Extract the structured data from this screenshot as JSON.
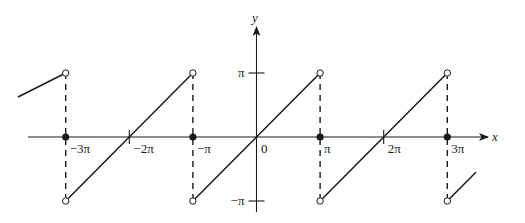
{
  "figure": {
    "title": "",
    "colors": {
      "ink": "#1a1a1a",
      "background": "#ffffff"
    }
  },
  "axes": {
    "x_label": "x",
    "y_label": "y",
    "origin_label": "0",
    "x_ticks": [
      {
        "value": -3,
        "label": "−3π"
      },
      {
        "value": -2,
        "label": "−2π"
      },
      {
        "value": -1,
        "label": "−π"
      },
      {
        "value": 1,
        "label": "π"
      },
      {
        "value": 2,
        "label": "2π"
      },
      {
        "value": 3,
        "label": "3π"
      }
    ],
    "y_ticks": [
      {
        "value": 1,
        "label": "π"
      },
      {
        "value": -1,
        "label": "−π"
      }
    ]
  },
  "plot": {
    "unit_x_px": 63.6,
    "unit_y_px": 64,
    "origin_px": [
      256.5,
      137
    ],
    "segments": [
      {
        "from": [
          -3.75,
          0.625
        ],
        "to": [
          -3,
          1
        ]
      },
      {
        "from": [
          -3,
          -1
        ],
        "to": [
          -1,
          1
        ]
      },
      {
        "from": [
          -1,
          -1
        ],
        "to": [
          1,
          1
        ]
      },
      {
        "from": [
          1,
          -1
        ],
        "to": [
          3,
          1
        ]
      },
      {
        "from": [
          3,
          -1
        ],
        "to": [
          3.45,
          -0.55
        ]
      }
    ],
    "discontinuities": [
      -3,
      -1,
      1,
      3
    ],
    "filled_points": [
      [
        -3,
        0
      ],
      [
        -1,
        0
      ],
      [
        1,
        0
      ],
      [
        3,
        0
      ]
    ],
    "open_points": [
      [
        -3,
        1
      ],
      [
        -3,
        -1
      ],
      [
        -1,
        1
      ],
      [
        -1,
        -1
      ],
      [
        1,
        1
      ],
      [
        1,
        -1
      ],
      [
        3,
        1
      ],
      [
        3,
        -1
      ]
    ]
  }
}
